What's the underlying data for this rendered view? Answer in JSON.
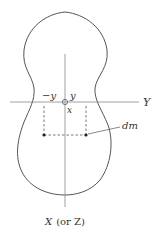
{
  "diagram": {
    "type": "rigid-body cross-section with axes",
    "labels": {
      "y_axis": "Y",
      "x_axis_italic": "X",
      "x_axis_paren": "(or Z)",
      "neg_y": "−y",
      "pos_y": "y",
      "x": "x",
      "dm": "dm"
    },
    "elements": {
      "body_outline": "closed curve (upper lobe, neck, larger lower lobe)",
      "origin_marker": "small circle at axis intersection",
      "mass_elements": [
        "dot at -y",
        "dot at +y"
      ],
      "dashed_guides": [
        "vertical at -y",
        "vertical at +y",
        "horizontal joining dots"
      ]
    },
    "colors": {
      "stroke": "#555555",
      "axis": "#888888",
      "text": "#333333"
    }
  }
}
